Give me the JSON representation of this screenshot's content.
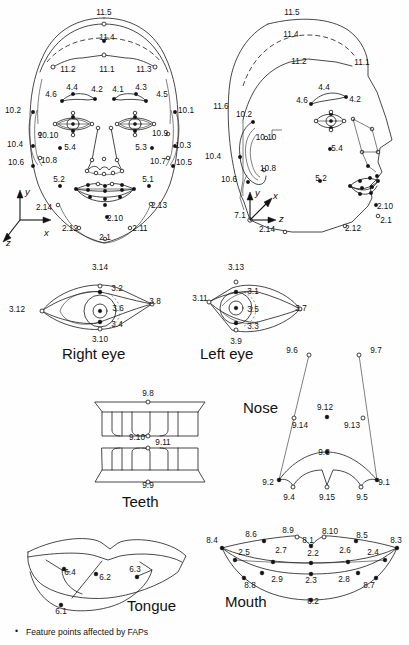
{
  "figure": {
    "background_color": "#fefefe",
    "line_color": "#1a1a1a",
    "point_fill_color": "#111111",
    "width": 409,
    "height": 645
  },
  "footnote": {
    "bullet": "•",
    "text": "Feature points affected by FAPs"
  },
  "captions": {
    "right_eye": "Right eye",
    "left_eye": "Left eye",
    "teeth": "Teeth",
    "nose": "Nose",
    "tongue": "Tongue",
    "mouth": "Mouth"
  },
  "axes": {
    "front": {
      "y": "y",
      "x": "x",
      "z": "z"
    },
    "profile": {
      "y": "y",
      "x": "x",
      "z": "z",
      "origin_label": "7.1"
    }
  },
  "front_face": {
    "labels": [
      {
        "id": "11.5",
        "x": 104,
        "y": 13
      },
      {
        "id": "11.4",
        "x": 107,
        "y": 38
      },
      {
        "id": "11.2",
        "x": 68,
        "y": 70
      },
      {
        "id": "11.1",
        "x": 107,
        "y": 70
      },
      {
        "id": "11.3",
        "x": 144,
        "y": 70
      },
      {
        "id": "4.4",
        "x": 72,
        "y": 88
      },
      {
        "id": "4.2",
        "x": 97,
        "y": 90
      },
      {
        "id": "4.1",
        "x": 118,
        "y": 90
      },
      {
        "id": "4.3",
        "x": 141,
        "y": 88
      },
      {
        "id": "4.6",
        "x": 51,
        "y": 95
      },
      {
        "id": "4.5",
        "x": 162,
        "y": 95
      },
      {
        "id": "10.2",
        "x": 13,
        "y": 111
      },
      {
        "id": "10.1",
        "x": 186,
        "y": 111
      },
      {
        "id": "10.10",
        "x": 48,
        "y": 136
      },
      {
        "id": "10.9",
        "x": 160,
        "y": 134
      },
      {
        "id": "5.4",
        "x": 70,
        "y": 148
      },
      {
        "id": "5.3",
        "x": 141,
        "y": 148
      },
      {
        "id": "10.4",
        "x": 15,
        "y": 145
      },
      {
        "id": "10.3",
        "x": 183,
        "y": 146
      },
      {
        "id": "10.8",
        "x": 49,
        "y": 161
      },
      {
        "id": "10.7",
        "x": 158,
        "y": 162
      },
      {
        "id": "10.6",
        "x": 16,
        "y": 163
      },
      {
        "id": "10.5",
        "x": 184,
        "y": 163
      },
      {
        "id": "5.2",
        "x": 59,
        "y": 180
      },
      {
        "id": "5.1",
        "x": 148,
        "y": 180
      },
      {
        "id": "2.14",
        "x": 44,
        "y": 208
      },
      {
        "id": "2.13",
        "x": 159,
        "y": 206
      },
      {
        "id": "2.10",
        "x": 115,
        "y": 219
      },
      {
        "id": "2.12",
        "x": 70,
        "y": 229
      },
      {
        "id": "2.11",
        "x": 140,
        "y": 229
      },
      {
        "id": "2.1",
        "x": 105,
        "y": 238
      }
    ]
  },
  "profile_face": {
    "labels": [
      {
        "id": "11.5",
        "x": 292,
        "y": 13
      },
      {
        "id": "11.4",
        "x": 291,
        "y": 35
      },
      {
        "id": "11.2",
        "x": 299,
        "y": 62
      },
      {
        "id": "11.1",
        "x": 362,
        "y": 63
      },
      {
        "id": "11.6",
        "x": 221,
        "y": 107
      },
      {
        "id": "4.4",
        "x": 324,
        "y": 88
      },
      {
        "id": "4.6",
        "x": 302,
        "y": 101
      },
      {
        "id": "4.2",
        "x": 355,
        "y": 100
      },
      {
        "id": "10.2",
        "x": 244,
        "y": 115
      },
      {
        "id": "10.10",
        "x": 266,
        "y": 138
      },
      {
        "id": "5.4",
        "x": 337,
        "y": 149
      },
      {
        "id": "10.4",
        "x": 213,
        "y": 157
      },
      {
        "id": "10.8",
        "x": 268,
        "y": 169
      },
      {
        "id": "10.6",
        "x": 229,
        "y": 180
      },
      {
        "id": "5.2",
        "x": 321,
        "y": 179
      },
      {
        "id": "7.1",
        "x": 240,
        "y": 216
      },
      {
        "id": "2.10",
        "x": 385,
        "y": 207
      },
      {
        "id": "2.1",
        "x": 386,
        "y": 221
      },
      {
        "id": "2.14",
        "x": 267,
        "y": 230
      },
      {
        "id": "2.12",
        "x": 353,
        "y": 229
      }
    ]
  },
  "right_eye": {
    "caption": "Right eye",
    "labels": [
      {
        "id": "3.14",
        "x": 100,
        "y": 268
      },
      {
        "id": "3.2",
        "x": 117,
        "y": 289
      },
      {
        "id": "3.8",
        "x": 155,
        "y": 302
      },
      {
        "id": "3.12",
        "x": 17,
        "y": 310
      },
      {
        "id": "3.6",
        "x": 118,
        "y": 309
      },
      {
        "id": "3.4",
        "x": 117,
        "y": 325
      },
      {
        "id": "3.10",
        "x": 100,
        "y": 340
      }
    ]
  },
  "left_eye": {
    "caption": "Left eye",
    "labels": [
      {
        "id": "3.13",
        "x": 236,
        "y": 268
      },
      {
        "id": "3.1",
        "x": 253,
        "y": 292
      },
      {
        "id": "3.11",
        "x": 200,
        "y": 299
      },
      {
        "id": "3.5",
        "x": 253,
        "y": 310
      },
      {
        "id": "3.7",
        "x": 301,
        "y": 309
      },
      {
        "id": "3.3",
        "x": 253,
        "y": 327
      },
      {
        "id": "3.9",
        "x": 236,
        "y": 342
      }
    ]
  },
  "teeth": {
    "caption": "Teeth",
    "labels": [
      {
        "id": "9.8",
        "x": 148,
        "y": 394
      },
      {
        "id": "9.10",
        "x": 137,
        "y": 438
      },
      {
        "id": "9.11",
        "x": 163,
        "y": 443
      },
      {
        "id": "9.9",
        "x": 148,
        "y": 486
      }
    ]
  },
  "nose": {
    "caption": "Nose",
    "labels": [
      {
        "id": "9.6",
        "x": 292,
        "y": 351
      },
      {
        "id": "9.7",
        "x": 376,
        "y": 351
      },
      {
        "id": "9.12",
        "x": 325,
        "y": 408
      },
      {
        "id": "9.14",
        "x": 300,
        "y": 426
      },
      {
        "id": "9.13",
        "x": 352,
        "y": 426
      },
      {
        "id": "9.3",
        "x": 324,
        "y": 453
      },
      {
        "id": "9.2",
        "x": 268,
        "y": 483
      },
      {
        "id": "9.1",
        "x": 384,
        "y": 483
      },
      {
        "id": "9.4",
        "x": 289,
        "y": 498
      },
      {
        "id": "9.15",
        "x": 327,
        "y": 498
      },
      {
        "id": "9.5",
        "x": 362,
        "y": 498
      }
    ]
  },
  "tongue": {
    "caption": "Tongue",
    "labels": [
      {
        "id": "6.4",
        "x": 70,
        "y": 573
      },
      {
        "id": "6.2",
        "x": 105,
        "y": 578
      },
      {
        "id": "6.3",
        "x": 135,
        "y": 570
      },
      {
        "id": "6.1",
        "x": 61,
        "y": 612
      }
    ]
  },
  "mouth": {
    "caption": "Mouth",
    "labels": [
      {
        "id": "8.4",
        "x": 212,
        "y": 541
      },
      {
        "id": "8.6",
        "x": 251,
        "y": 535
      },
      {
        "id": "8.9",
        "x": 288,
        "y": 531
      },
      {
        "id": "8.1",
        "x": 308,
        "y": 541
      },
      {
        "id": "8.10",
        "x": 330,
        "y": 532
      },
      {
        "id": "8.5",
        "x": 362,
        "y": 536
      },
      {
        "id": "8.3",
        "x": 396,
        "y": 541
      },
      {
        "id": "2.5",
        "x": 244,
        "y": 553
      },
      {
        "id": "2.7",
        "x": 281,
        "y": 551
      },
      {
        "id": "2.2",
        "x": 313,
        "y": 554
      },
      {
        "id": "2.6",
        "x": 345,
        "y": 551
      },
      {
        "id": "2.4",
        "x": 373,
        "y": 553
      },
      {
        "id": "8.8",
        "x": 250,
        "y": 586
      },
      {
        "id": "2.9",
        "x": 277,
        "y": 580
      },
      {
        "id": "2.3",
        "x": 311,
        "y": 581
      },
      {
        "id": "2.8",
        "x": 344,
        "y": 580
      },
      {
        "id": "8.7",
        "x": 369,
        "y": 586
      },
      {
        "id": "8.2",
        "x": 313,
        "y": 602
      }
    ]
  }
}
